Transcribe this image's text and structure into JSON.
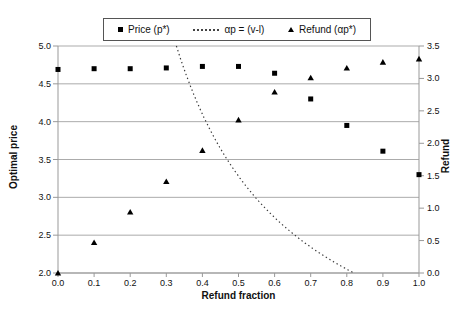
{
  "chart_data": {
    "type": "scatter",
    "x": [
      0.0,
      0.1,
      0.2,
      0.3,
      0.4,
      0.5,
      0.6,
      0.7,
      0.8,
      0.9,
      1.0
    ],
    "series": [
      {
        "name": "Price (p*)",
        "axis": "left",
        "marker": "square",
        "values": [
          4.69,
          4.7,
          4.7,
          4.71,
          4.73,
          4.73,
          4.64,
          4.3,
          3.95,
          3.61,
          3.3
        ]
      },
      {
        "name": "Refund (αp*)",
        "axis": "right",
        "marker": "triangle",
        "values": [
          0.0,
          0.47,
          0.94,
          1.41,
          1.89,
          2.36,
          2.79,
          3.01,
          3.16,
          3.25,
          3.3
        ]
      }
    ],
    "curve": {
      "name": "αp = (v-l)",
      "style": "dotted",
      "formula": "price = (v-l)/alpha",
      "v_minus_l": 1.64,
      "p_range": [
        2.0,
        5.0
      ]
    },
    "xlabel": "Refund fraction",
    "ylabel_left": "Optimal price",
    "ylabel_right": "Refund",
    "axes": {
      "x": {
        "min": 0.0,
        "max": 1.0,
        "ticks": [
          "0.0",
          "0.1",
          "0.2",
          "0.3",
          "0.4",
          "0.5",
          "0.6",
          "0.7",
          "0.8",
          "0.9",
          "1.0"
        ]
      },
      "left": {
        "min": 2.0,
        "max": 5.0,
        "ticks": [
          "2.0",
          "2.5",
          "3.0",
          "3.5",
          "4.0",
          "4.5",
          "5.0"
        ]
      },
      "right": {
        "min": 0.0,
        "max": 3.5,
        "ticks": [
          "0.0",
          "0.5",
          "1.0",
          "1.5",
          "2.0",
          "2.5",
          "3.0",
          "3.5"
        ]
      }
    },
    "legend": {
      "position": "top-center",
      "entries": [
        "Price (p*)",
        "αp = (v-l)",
        "Refund (αp*)"
      ]
    },
    "grid": "horizontal-only",
    "colors": {
      "marker": "#000000",
      "gridline": "#ababab",
      "axis": "#999999",
      "curve": "#3a3a3a",
      "legend_border": "#555555",
      "text": "#111111",
      "background": "#ffffff"
    }
  }
}
